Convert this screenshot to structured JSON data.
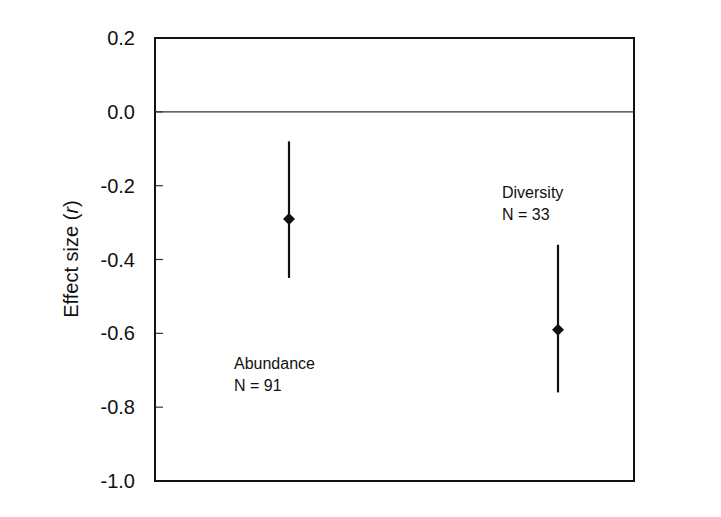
{
  "chart_data": {
    "type": "scatter",
    "subtype": "point-with-error-bars",
    "title": "",
    "xlabel": "",
    "ylabel": "Effect size (r)",
    "ylabel_parts": {
      "prefix": "Effect size (",
      "italic": "r",
      "suffix": ")"
    },
    "ylim": [
      -1.0,
      0.2
    ],
    "yticks": [
      0.2,
      0.0,
      -0.2,
      -0.4,
      -0.6,
      -0.8,
      -1.0
    ],
    "ytick_labels": [
      "0.2",
      "0.0",
      "-0.2",
      "-0.4",
      "-0.6",
      "-0.8",
      "-1.0"
    ],
    "reference_line": 0.0,
    "grid": false,
    "legend": null,
    "categories": [
      "Abundance",
      "Diversity"
    ],
    "series": [
      {
        "name": "Effect size",
        "points": [
          {
            "category": "Abundance",
            "n_label": "N = 91",
            "value": -0.29,
            "ci_low": -0.45,
            "ci_high": -0.08
          },
          {
            "category": "Diversity",
            "n_label": "N = 33",
            "value": -0.59,
            "ci_low": -0.76,
            "ci_high": -0.36
          }
        ]
      }
    ],
    "annotations": [
      {
        "text": "Abundance",
        "line2": "N = 91"
      },
      {
        "text": "Diversity",
        "line2": "N = 33"
      }
    ]
  }
}
